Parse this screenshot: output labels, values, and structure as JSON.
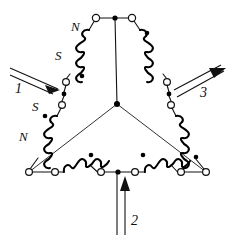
{
  "figure": {
    "background_color": "#ffffff",
    "line_color": "#111111",
    "width": 236,
    "height": 242
  },
  "labels": {
    "pole_upper_left_n": "N",
    "pole_upper_left_s": "S",
    "pole_lower_left_s": "S",
    "pole_lower_left_n": "N",
    "phase_1": "1",
    "phase_2": "2",
    "phase_3": "3"
  },
  "icons": {
    "terminal": "open-circle-terminal",
    "node": "filled-junction-dot",
    "polarity": "winding-polarity-dot",
    "coil": "helical-coil",
    "arrow_in": "current-arrow-inward",
    "arrow_out": "current-arrow-outward"
  },
  "terminals": [
    {
      "name": "terminal-top-left",
      "x": 96,
      "y": 18
    },
    {
      "name": "terminal-top-right",
      "x": 132,
      "y": 18
    },
    {
      "name": "terminal-left-upper",
      "x": 66,
      "y": 82
    },
    {
      "name": "terminal-left-lower",
      "x": 62,
      "y": 105
    },
    {
      "name": "terminal-right-upper",
      "x": 167,
      "y": 82
    },
    {
      "name": "terminal-right-lower",
      "x": 171,
      "y": 105
    },
    {
      "name": "terminal-bottom-left-vertex",
      "x": 29,
      "y": 172
    },
    {
      "name": "terminal-bottom-left-inner",
      "x": 55,
      "y": 172
    },
    {
      "name": "terminal-bottom-mid-left",
      "x": 101,
      "y": 172
    },
    {
      "name": "terminal-bottom-mid-right",
      "x": 135,
      "y": 172
    },
    {
      "name": "terminal-bottom-right-inner",
      "x": 181,
      "y": 172
    },
    {
      "name": "terminal-bottom-right-vertex",
      "x": 206,
      "y": 172
    }
  ],
  "nodes": [
    {
      "name": "node-top-center",
      "x": 115,
      "y": 18
    },
    {
      "name": "node-star-center",
      "x": 117,
      "y": 104
    },
    {
      "name": "node-bottom-center",
      "x": 118,
      "y": 172
    },
    {
      "name": "node-left-junction",
      "x": 64,
      "y": 94
    },
    {
      "name": "node-right-junction",
      "x": 169,
      "y": 94
    }
  ],
  "polarity_dots": [
    {
      "name": "polarity-dot-upper-left",
      "x": 82,
      "y": 76
    },
    {
      "name": "polarity-dot-upper-right",
      "x": 147,
      "y": 33
    },
    {
      "name": "polarity-dot-lower-left",
      "x": 45,
      "y": 116
    },
    {
      "name": "polarity-dot-lower-right",
      "x": 196,
      "y": 157
    },
    {
      "name": "polarity-dot-bottom-left",
      "x": 91,
      "y": 155
    },
    {
      "name": "polarity-dot-bottom-right",
      "x": 143,
      "y": 155
    }
  ],
  "phase_leads": [
    {
      "name": "phase-lead-1",
      "label": "1",
      "direction": "in",
      "label_x": 18,
      "label_y": 88
    },
    {
      "name": "phase-lead-2",
      "label": "2",
      "direction": "in",
      "label_x": 128,
      "label_y": 222
    },
    {
      "name": "phase-lead-3",
      "label": "3",
      "direction": "out",
      "label_x": 203,
      "label_y": 92
    }
  ],
  "pole_labels": [
    {
      "name": "pole-label-n-upper",
      "text": "N",
      "x": 74,
      "y": 26
    },
    {
      "name": "pole-label-s-upper",
      "text": "S",
      "x": 58,
      "y": 55
    },
    {
      "name": "pole-label-s-lower",
      "text": "S",
      "x": 35,
      "y": 106
    },
    {
      "name": "pole-label-n-lower",
      "text": "N",
      "x": 22,
      "y": 136
    }
  ]
}
